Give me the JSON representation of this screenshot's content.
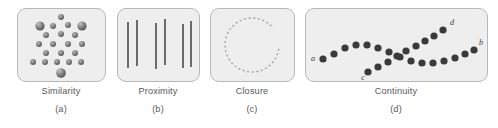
{
  "figure": {
    "width": 498,
    "height": 128,
    "background": "#ffffff",
    "panel_fill": "#eeeeee",
    "panel_stroke": "#b8b8b8",
    "caption_color": "#58585a",
    "dot_color_dark": "#3a3a3a",
    "dot_color_gray": "#6f6f6f",
    "line_color": "#4a4a4a",
    "dashed_circle_color": "#a9a9a9"
  },
  "panels": [
    {
      "id": "similarity",
      "name": "Similarity",
      "letter": "(a)",
      "x": 17,
      "y": 8,
      "w": 89,
      "h": 74,
      "caption_center": 61
    },
    {
      "id": "proximity",
      "name": "Proximity",
      "letter": "(b)",
      "x": 117,
      "y": 8,
      "w": 83,
      "h": 74,
      "caption_center": 158
    },
    {
      "id": "closure",
      "name": "Closure",
      "letter": "(c)",
      "x": 210,
      "y": 8,
      "w": 85,
      "h": 74,
      "caption_center": 252
    },
    {
      "id": "continuity",
      "name": "Continuity",
      "letter": "(d)",
      "x": 305,
      "y": 8,
      "w": 183,
      "h": 74,
      "caption_center": 396
    }
  ],
  "chart_data": {
    "type": "scatter",
    "xlabel": "",
    "ylabel": "",
    "panels": [
      {
        "label": "Similarity",
        "letter": "(a)",
        "description": "Triangular array of spheres; four large spheres among small spheres group by size similarity",
        "dots": [
          {
            "cx": 61,
            "cy": 17,
            "r": 3.0,
            "size": "small"
          },
          {
            "cx": 40,
            "cy": 26,
            "r": 4.6,
            "size": "large"
          },
          {
            "cx": 53,
            "cy": 26,
            "r": 3.0,
            "size": "small"
          },
          {
            "cx": 68,
            "cy": 25,
            "r": 3.0,
            "size": "small"
          },
          {
            "cx": 82,
            "cy": 26,
            "r": 4.6,
            "size": "large"
          },
          {
            "cx": 46,
            "cy": 35,
            "r": 3.0,
            "size": "small"
          },
          {
            "cx": 61,
            "cy": 34,
            "r": 3.0,
            "size": "small"
          },
          {
            "cx": 75,
            "cy": 35,
            "r": 3.0,
            "size": "small"
          },
          {
            "cx": 39,
            "cy": 44,
            "r": 3.0,
            "size": "small"
          },
          {
            "cx": 53,
            "cy": 44,
            "r": 3.0,
            "size": "small"
          },
          {
            "cx": 68,
            "cy": 44,
            "r": 3.0,
            "size": "small"
          },
          {
            "cx": 82,
            "cy": 44,
            "r": 3.0,
            "size": "small"
          },
          {
            "cx": 46,
            "cy": 53,
            "r": 3.0,
            "size": "small"
          },
          {
            "cx": 61,
            "cy": 53,
            "r": 3.0,
            "size": "small"
          },
          {
            "cx": 75,
            "cy": 53,
            "r": 3.0,
            "size": "small"
          },
          {
            "cx": 33,
            "cy": 62,
            "r": 3.0,
            "size": "small"
          },
          {
            "cx": 45,
            "cy": 62,
            "r": 3.0,
            "size": "small"
          },
          {
            "cx": 57,
            "cy": 62,
            "r": 3.0,
            "size": "small"
          },
          {
            "cx": 69,
            "cy": 62,
            "r": 3.0,
            "size": "small"
          },
          {
            "cx": 81,
            "cy": 62,
            "r": 3.0,
            "size": "small"
          },
          {
            "cx": 61,
            "cy": 73,
            "r": 4.8,
            "size": "large"
          }
        ]
      },
      {
        "label": "Proximity",
        "letter": "(b)",
        "description": "Six vertical lines grouped into three pairs by spacing",
        "lines": [
          {
            "x": 128,
            "y1": 22,
            "y2": 68
          },
          {
            "x": 137,
            "y1": 20,
            "y2": 66
          },
          {
            "x": 156,
            "y1": 23,
            "y2": 69
          },
          {
            "x": 165,
            "y1": 19,
            "y2": 65
          },
          {
            "x": 183,
            "y1": 24,
            "y2": 68
          },
          {
            "x": 191,
            "y1": 21,
            "y2": 67
          }
        ]
      },
      {
        "label": "Closure",
        "letter": "(c)",
        "description": "Dashed circle with a gap on the right; perceived as a complete circle",
        "circle": {
          "cx": 252,
          "cy": 45,
          "r": 27,
          "gap_start_deg": -38,
          "gap_end_deg": 8,
          "dash": "2.2 2.4"
        }
      },
      {
        "label": "Continuity",
        "letter": "(d)",
        "description": "Two crossing dotted curves; dots follow smooth paths a-to-b and c-to-d rather than turning at the intersection",
        "curves": [
          {
            "name": "a-b",
            "start_label": "a",
            "end_label": "b",
            "dots": [
              {
                "cx": 323,
                "cy": 59
              },
              {
                "cx": 334,
                "cy": 54
              },
              {
                "cx": 345,
                "cy": 48
              },
              {
                "cx": 356,
                "cy": 45
              },
              {
                "cx": 367,
                "cy": 45
              },
              {
                "cx": 378,
                "cy": 48
              },
              {
                "cx": 389,
                "cy": 52
              },
              {
                "cx": 400,
                "cy": 57
              },
              {
                "cx": 411,
                "cy": 61
              },
              {
                "cx": 422,
                "cy": 63
              },
              {
                "cx": 433,
                "cy": 63
              },
              {
                "cx": 444,
                "cy": 61
              },
              {
                "cx": 455,
                "cy": 58
              },
              {
                "cx": 465,
                "cy": 54
              },
              {
                "cx": 474,
                "cy": 50
              }
            ]
          },
          {
            "name": "c-d",
            "start_label": "c",
            "end_label": "d",
            "dots": [
              {
                "cx": 368,
                "cy": 72
              },
              {
                "cx": 378,
                "cy": 67
              },
              {
                "cx": 388,
                "cy": 62
              },
              {
                "cx": 397,
                "cy": 56
              },
              {
                "cx": 406,
                "cy": 51
              },
              {
                "cx": 416,
                "cy": 46
              },
              {
                "cx": 425,
                "cy": 41
              },
              {
                "cx": 434,
                "cy": 36
              },
              {
                "cx": 443,
                "cy": 30
              }
            ]
          }
        ],
        "labels": [
          {
            "text": "a",
            "x": 313,
            "y": 61
          },
          {
            "text": "b",
            "x": 481,
            "y": 45
          },
          {
            "text": "c",
            "x": 363,
            "y": 80
          },
          {
            "text": "d",
            "x": 452,
            "y": 25
          }
        ]
      }
    ]
  }
}
